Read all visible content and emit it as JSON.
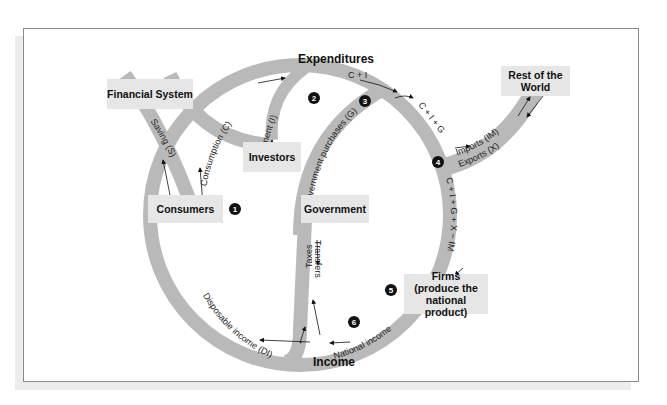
{
  "diagram": {
    "title_top": "Expenditures",
    "title_bottom": "Income",
    "nodes": {
      "financial_system": "Financial System",
      "investors": "Investors",
      "consumers": "Consumers",
      "government": "Government",
      "rest_of_world_1": "Rest of the",
      "rest_of_world_2": "World",
      "firms_1": "Firms",
      "firms_2": "(produce the",
      "firms_3": "national product)"
    },
    "flows": {
      "saving": "Saving (S)",
      "consumption": "Consumption (C)",
      "investment": "Investment (I)",
      "c_plus_i": "C + I",
      "government_purchases": "Government purchases (G)",
      "c_i_g": "C + I + G",
      "imports": "Imports (IM)",
      "exports": "Exports (X)",
      "c_i_g_x_im": "C + I + G + X − IM",
      "national_income": "National income",
      "disposable_income": "Disposable income (DI)",
      "taxes": "Taxes",
      "transfers": "Transfers"
    },
    "markers": [
      "1",
      "2",
      "3",
      "4",
      "5",
      "6"
    ],
    "colors": {
      "band": "#b9b9b9",
      "box": "#e6e6e6",
      "marker": "#111111"
    }
  }
}
